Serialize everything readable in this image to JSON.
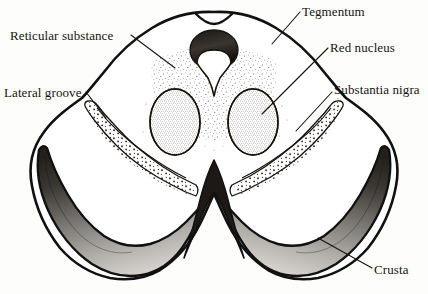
{
  "figure": {
    "background_color": "#fdfdfc",
    "ink_color": "#17140f"
  },
  "labels": [
    {
      "id": "reticular-substance",
      "text": "Reticular substance",
      "side": "left"
    },
    {
      "id": "lateral-groove",
      "text": "Lateral groove",
      "side": "left"
    },
    {
      "id": "tegmentum",
      "text": "Tegmentum",
      "side": "right"
    },
    {
      "id": "red-nucleus",
      "text": "Red nucleus",
      "side": "right"
    },
    {
      "id": "substantia-nigra",
      "text": "Substantia nigra",
      "side": "right"
    },
    {
      "id": "crusta",
      "text": "Crusta",
      "side": "right"
    }
  ],
  "structures": {
    "outline": "midbrain-cross-section-outline",
    "aqueduct": "cerebral-aqueduct",
    "red_nucleus_left": "red-nucleus-left",
    "red_nucleus_right": "red-nucleus-right",
    "substantia_nigra_left": "substantia-nigra-band-left",
    "substantia_nigra_right": "substantia-nigra-band-right",
    "crusta_left": "crusta-band-left",
    "crusta_right": "crusta-band-right",
    "reticular_substance": "reticular-substance-stipple",
    "interpeduncular_fossa": "interpeduncular-fossa"
  },
  "colors": {
    "ink": "#17140f",
    "outline": "#111111",
    "crusta_dark": "#2b2723",
    "crusta_mid": "#6e6a66",
    "crusta_light": "#c9c6c2",
    "stipple": "#3a3631",
    "paper": "#fdfdfc"
  }
}
